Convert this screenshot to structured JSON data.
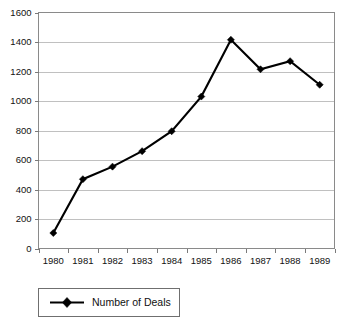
{
  "chart_data": {
    "type": "line",
    "title": "",
    "subtitle": "",
    "xlabel": "",
    "ylabel": "",
    "categories": [
      "1980",
      "1981",
      "1982",
      "1983",
      "1984",
      "1985",
      "1986",
      "1987",
      "1988",
      "1989"
    ],
    "series": [
      {
        "name": "Number of Deals",
        "values": [
          105,
          470,
          555,
          660,
          795,
          1030,
          1415,
          1215,
          1270,
          1110
        ],
        "marker": "diamond",
        "color": "#000000"
      }
    ],
    "ylim": [
      0,
      1600
    ],
    "yticks": [
      0,
      200,
      400,
      600,
      800,
      1000,
      1200,
      1400,
      1600
    ],
    "ytick_labels": [
      "0",
      "200",
      "400",
      "600",
      "800",
      "1000",
      "1200",
      "1400",
      "1600"
    ],
    "xtick_labels": [
      "1980",
      "1981",
      "1982",
      "1983",
      "1984",
      "1985",
      "1986",
      "1987",
      "1988",
      "1989"
    ],
    "grid": {
      "horizontal": true,
      "vertical": false,
      "color": "#b9b9b9"
    },
    "legend": {
      "position": "bottom-left",
      "entries": [
        "Number of Deals"
      ],
      "boxed": true
    },
    "colors": {
      "series": "#000000",
      "grid": "#b9b9b9",
      "axis": "#7a7a7a",
      "frame": "#8a8a8a",
      "background": "#ffffff",
      "text": "#111111"
    }
  }
}
